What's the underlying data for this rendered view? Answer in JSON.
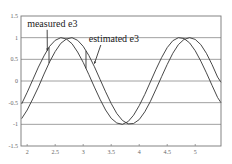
{
  "chart_data": {
    "type": "line",
    "title": "",
    "xlabel": "",
    "ylabel": "",
    "xlim": [
      1.89,
      5.46
    ],
    "ylim": [
      -1.5,
      1.5
    ],
    "grid": "horizontal",
    "legend": "none",
    "x_ticks": [
      "2",
      "2.5",
      "3",
      "3.5",
      "4",
      "4.5",
      "5"
    ],
    "y_ticks": [
      "1.5",
      "1",
      "0.5",
      "0",
      "-0.5",
      "-1",
      "-1.5"
    ],
    "series": [
      {
        "name": "measured e3",
        "x": [
          1.9,
          2.0,
          2.1,
          2.2,
          2.3,
          2.4,
          2.5,
          2.6,
          2.7,
          2.8,
          2.9,
          3.0,
          3.1,
          3.2,
          3.3,
          3.4,
          3.5,
          3.6,
          3.7,
          3.8,
          3.9,
          4.0,
          4.1,
          4.2,
          4.3,
          4.4,
          4.5,
          4.6,
          4.7,
          4.8,
          4.9,
          5.0,
          5.1,
          5.2,
          5.3,
          5.4,
          5.46
        ],
        "values": [
          -0.53,
          -0.26,
          0.03,
          0.32,
          0.58,
          0.8,
          0.94,
          1.0,
          0.97,
          0.86,
          0.67,
          0.43,
          0.15,
          -0.14,
          -0.42,
          -0.67,
          -0.86,
          -0.97,
          -1.0,
          -0.94,
          -0.79,
          -0.57,
          -0.31,
          -0.02,
          0.27,
          0.54,
          0.77,
          0.93,
          1.0,
          0.98,
          0.88,
          0.7,
          0.46,
          0.19,
          -0.1,
          -0.38,
          -0.5
        ]
      },
      {
        "name": "estimated e3",
        "x": [
          1.9,
          2.0,
          2.1,
          2.2,
          2.3,
          2.4,
          2.5,
          2.6,
          2.7,
          2.8,
          2.9,
          3.0,
          3.1,
          3.2,
          3.3,
          3.4,
          3.5,
          3.6,
          3.7,
          3.8,
          3.9,
          4.0,
          4.1,
          4.2,
          4.3,
          4.4,
          4.5,
          4.6,
          4.7,
          4.8,
          4.9,
          5.0,
          5.1,
          5.2,
          5.3,
          5.4,
          5.46
        ],
        "values": [
          -0.87,
          -0.67,
          -0.41,
          -0.14,
          0.16,
          0.44,
          0.68,
          0.87,
          0.97,
          1.0,
          0.94,
          0.8,
          0.59,
          0.33,
          0.04,
          -0.25,
          -0.52,
          -0.75,
          -0.91,
          -0.99,
          -0.98,
          -0.89,
          -0.71,
          -0.47,
          -0.19,
          0.1,
          0.38,
          0.64,
          0.84,
          0.96,
          1.0,
          0.96,
          0.84,
          0.64,
          0.38,
          0.09,
          -0.03
        ]
      }
    ],
    "annotations": [
      {
        "text": "measured e3",
        "label_x": 2.0,
        "label_y": 1.25,
        "arrow_to_x": 2.36,
        "arrow_to_y": 0.7,
        "marker_x": 2.39
      },
      {
        "text": "estimated e3",
        "label_x": 3.1,
        "label_y": 0.9,
        "arrow_to_x": 3.2,
        "arrow_to_y": 0.4,
        "marker_x": 3.05
      }
    ]
  }
}
